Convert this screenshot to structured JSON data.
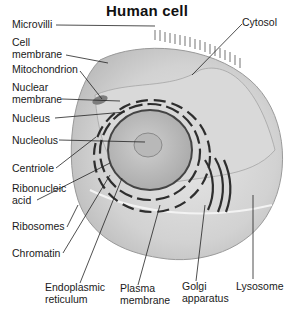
{
  "title": "Human cell",
  "labels": {
    "microvilli": "Microvilli",
    "cell_membrane_1": "Cell",
    "cell_membrane_2": "membrane",
    "mitochondrion": "Mitochondrion",
    "nuclear_membrane_1": "Nuclear",
    "nuclear_membrane_2": "membrane",
    "nucleus": "Nucleus",
    "nucleolus": "Nucleolus",
    "centriole": "Centriole",
    "ribonucleic_1": "Ribonucleic",
    "ribonucleic_2": "acid",
    "ribosomes": "Ribosomes",
    "chromatin": "Chromatin",
    "er_1": "Endoplasmic",
    "er_2": "reticulum",
    "plasma_1": "Plasma",
    "plasma_2": "membrane",
    "golgi_1": "Golgi",
    "golgi_2": "apparatus",
    "lysosome": "Lysosome",
    "cytosol": "Cytosol"
  }
}
